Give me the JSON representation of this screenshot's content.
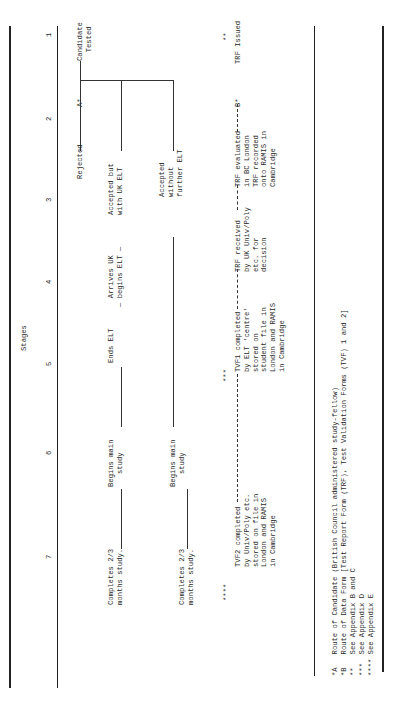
{
  "title": "Stages",
  "stages": [
    "1",
    "2",
    "3",
    "4",
    "5",
    "6",
    "7"
  ],
  "route_a": {
    "marker": "A*",
    "candidate": "Candidate\n  Tested",
    "rejected": "Rejected",
    "accepted_elt": "Accepted but\nwith UK ELT",
    "accepted_no_elt": "Accepted\nwithout\nfurther ELT",
    "arrives": "  Arrives UK\n— begins ELT —",
    "ends_elt": "Ends ELT",
    "begins_main_1": "Begins main\n   study",
    "begins_main_2": "Begins main\n   study",
    "completes_1": "Completes 2/3\nmonths study.",
    "completes_2": "Completes 2/3\nmonths study."
  },
  "route_b": {
    "marker": "B*",
    "note_b": "**",
    "trf_issued": "TRF Issued",
    "trf_evaluated": "TRF evaluated\nin BC London\nTRF recorded\nonto RAMIS in\nCambridge",
    "trf_received": "TRF received\nby UK Univ/Poly\netc. for\ndecision",
    "note_d": "***",
    "tvf1": "TVF1 completed\nby ELT 'centre'\nstored on\nstudent file in\nLondon and RAMIS\nin Cambridge",
    "note_e": "****",
    "tvf2": "TVF2 completed\nby Univ/Poly etc.\nstored on file in\nLondon and RAMIS\nin Cambridge"
  },
  "footnotes": [
    "*A   Route of Candidate (British Council administered study-fellow)",
    "*B   Route of Data Form [Test Report Form (TRF), Test Validation Forms (TVF) 1 and 2]",
    "**   See Appendix B and C",
    "***  See Appendix D",
    "**** See Appendix E"
  ]
}
